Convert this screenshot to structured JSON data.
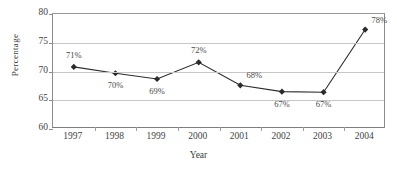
{
  "chart_data": {
    "type": "line",
    "title": "",
    "xlabel": "Year",
    "ylabel": "Percentage",
    "categories": [
      "1997",
      "1998",
      "1999",
      "2000",
      "2001",
      "2002",
      "2003",
      "2004"
    ],
    "values": [
      70.8,
      69.7,
      68.7,
      71.6,
      67.6,
      66.5,
      66.4,
      77.3
    ],
    "point_labels": [
      "71%",
      "70%",
      "69%",
      "72%",
      "68%",
      "67%",
      "67%",
      "78%"
    ],
    "point_label_positions": [
      "above",
      "below",
      "below",
      "above",
      "above-right",
      "below",
      "below",
      "above-right"
    ],
    "ylim": [
      60,
      80
    ],
    "yticks": [
      "60",
      "65",
      "70",
      "75",
      "80"
    ],
    "ytick_values": [
      60,
      65,
      70,
      75,
      80
    ],
    "grid": true,
    "legend": "none",
    "marker": "diamond",
    "series_color": "#2b2b2b",
    "grid_color": "#c6c6c6",
    "axis_color": "#8c8c8c",
    "background_color": "#ffffff"
  }
}
